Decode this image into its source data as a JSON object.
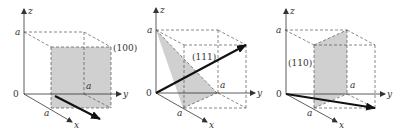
{
  "figure": {
    "panels": [
      {
        "id": "panel-100",
        "plane_label": "(100)",
        "axes": {
          "x": "x",
          "y": "y",
          "z": "z",
          "origin": "0"
        },
        "edge_labels": {
          "z": "a",
          "y": "a",
          "x": "a"
        }
      },
      {
        "id": "panel-111",
        "plane_label": "(111)",
        "axes": {
          "x": "x",
          "y": "y",
          "z": "z",
          "origin": "0"
        },
        "edge_labels": {
          "z": "a",
          "y": "a",
          "x": "a"
        }
      },
      {
        "id": "panel-110",
        "plane_label": "(110)",
        "axes": {
          "x": "x",
          "y": "y",
          "z": "z",
          "origin": "0"
        },
        "edge_labels": {
          "z": "a",
          "y": "a",
          "x": "a"
        }
      }
    ],
    "colors": {
      "plane_fill": "#c8c8c8",
      "lines": "#333333",
      "vector": "#111111"
    }
  }
}
